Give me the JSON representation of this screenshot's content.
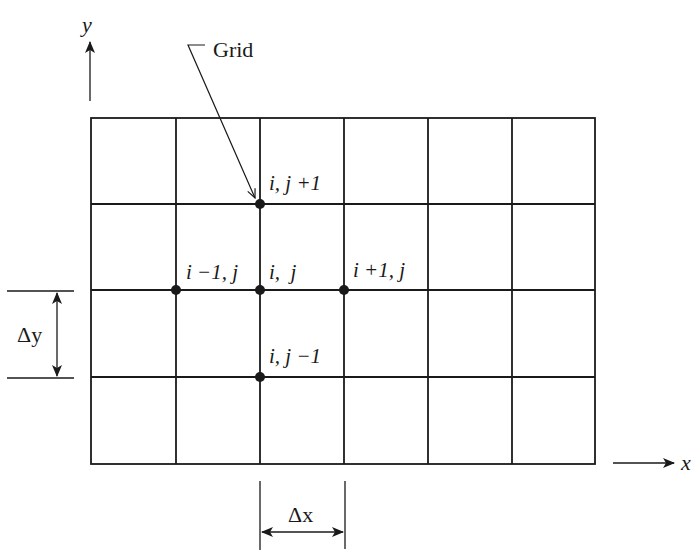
{
  "diagram": {
    "colors": {
      "line": "#1a1a1a",
      "background": "#ffffff"
    },
    "grid": {
      "x_lines": [
        91,
        176,
        260,
        344,
        428,
        512,
        595
      ],
      "y_lines": [
        118,
        204,
        290,
        377,
        464
      ],
      "columns": 6,
      "rows": 4
    },
    "axes": {
      "x_label": "x",
      "y_label": "y"
    },
    "callout": {
      "label": "Grid"
    },
    "nodes": [
      {
        "id": "center",
        "label_i": "i,",
        "label_j": "j",
        "text": "i,  j",
        "cx": 260,
        "cy": 290
      },
      {
        "id": "top",
        "text": "i, j +1",
        "cx": 260,
        "cy": 204
      },
      {
        "id": "bottom",
        "text": "i, j −1",
        "cx": 260,
        "cy": 377
      },
      {
        "id": "left",
        "text": "i −1, j",
        "cx": 176,
        "cy": 290
      },
      {
        "id": "right",
        "text": "i +1, j",
        "cx": 344,
        "cy": 290
      }
    ],
    "labels": {
      "center": "i,  j",
      "top": "i, j +1",
      "bottom": "i, j −1",
      "left": "i −1, j",
      "right": "i +1, j",
      "delta_x": "Δx",
      "delta_y": "Δy"
    }
  }
}
